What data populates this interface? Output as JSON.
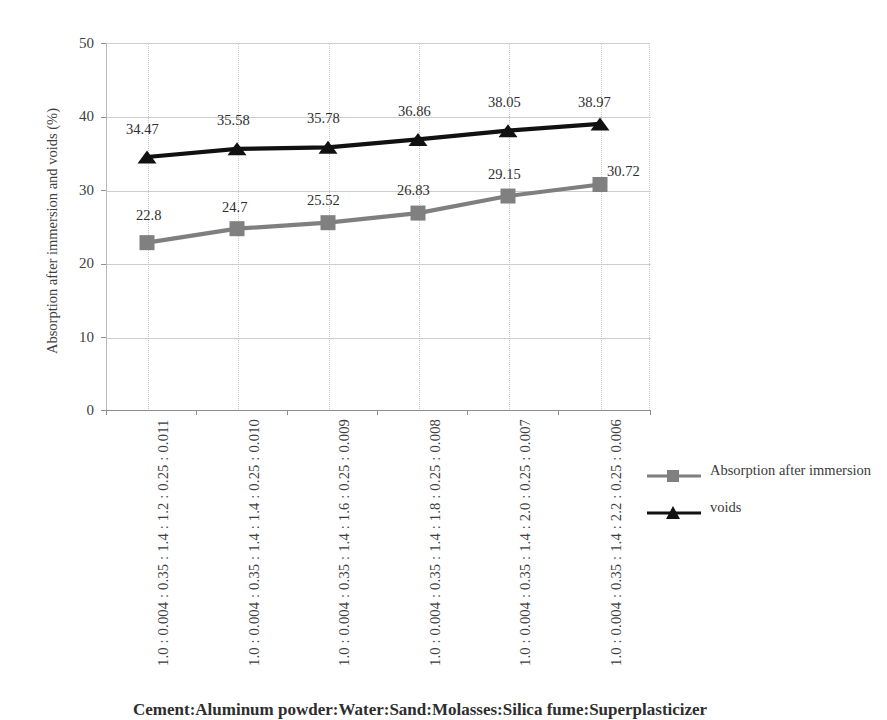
{
  "chart_data": {
    "type": "line",
    "title": "",
    "xlabel": "",
    "ylabel": "Absorption after immersion and voids (%)",
    "ylim": [
      0,
      50
    ],
    "yticks": [
      0,
      10,
      20,
      30,
      40,
      50
    ],
    "grid": true,
    "legend_position": "right",
    "categories": [
      "1.0 : 0.004 : 0.35 : 1.4 : 1.2 : 0.25 : 0.011",
      "1.0 : 0.004 : 0.35 : 1.4 : 1.4 : 0.25 : 0.010",
      "1.0 : 0.004 : 0.35 : 1.4 : 1.6 : 0.25 : 0.009",
      "1.0 : 0.004 : 0.35 : 1.4 : 1.8 : 0.25 : 0.008",
      "1.0 : 0.004 : 0.35 : 1.4 : 2.0 : 0.25 : 0.007",
      "1.0 : 0.004 : 0.35 : 1.4 : 2.2 : 0.25 : 0.006"
    ],
    "series": [
      {
        "name": "Absorption after immersion",
        "marker": "square",
        "color": "#808080",
        "values": [
          22.8,
          24.7,
          25.52,
          26.83,
          29.15,
          30.72
        ],
        "labels": [
          "22.8",
          "24.7",
          "25.52",
          "26.83",
          "29.15",
          "30.72"
        ]
      },
      {
        "name": "voids",
        "marker": "triangle",
        "color": "#111111",
        "values": [
          34.47,
          35.58,
          35.78,
          36.86,
          38.05,
          38.97
        ],
        "labels": [
          "34.47",
          "35.58",
          "35.78",
          "36.86",
          "38.05",
          "38.97"
        ]
      }
    ]
  },
  "legend": {
    "items": [
      {
        "label": "Absorption after immersion",
        "marker": "square",
        "color": "#808080"
      },
      {
        "label": "voids",
        "marker": "triangle",
        "color": "#111111"
      }
    ]
  },
  "caption": {
    "text": "Cement:Aluminum powder:Water:Sand:Molasses:Silica fume:Superplasticizer"
  },
  "colors": {
    "absorption_series": "#808080",
    "voids_series": "#111111",
    "gridline": "#cdcdcd",
    "axis": "#8e8e8e",
    "text": "#3d3d3d"
  }
}
